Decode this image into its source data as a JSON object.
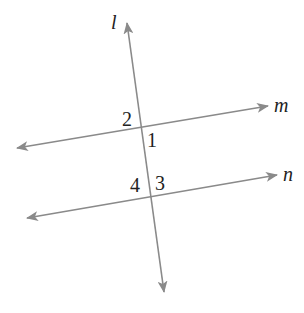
{
  "diagram": {
    "colors": {
      "line": "#8a8a8a",
      "text": "#222222",
      "background": "#ffffff"
    },
    "lines": [
      {
        "id": "l",
        "label": "l",
        "start": [
          164,
          292
        ],
        "end": [
          127,
          23
        ],
        "bidirectional": true,
        "label_pos": [
          111,
          29
        ]
      },
      {
        "id": "m",
        "label": "m",
        "start": [
          17,
          148
        ],
        "end": [
          268,
          106
        ],
        "bidirectional": true,
        "label_pos": [
          274,
          112
        ]
      },
      {
        "id": "n",
        "label": "n",
        "start": [
          27,
          218
        ],
        "end": [
          277,
          175
        ],
        "bidirectional": true,
        "label_pos": [
          283,
          181
        ]
      }
    ],
    "intersections": [
      {
        "lines": [
          "l",
          "m"
        ],
        "point": [
          142,
          128
        ]
      },
      {
        "lines": [
          "l",
          "n"
        ],
        "point": [
          152,
          197
        ]
      }
    ],
    "angles": [
      {
        "label": "1",
        "pos": [
          147,
          147
        ]
      },
      {
        "label": "2",
        "pos": [
          122,
          126
        ]
      },
      {
        "label": "3",
        "pos": [
          155,
          190
        ]
      },
      {
        "label": "4",
        "pos": [
          130,
          192
        ]
      }
    ]
  }
}
